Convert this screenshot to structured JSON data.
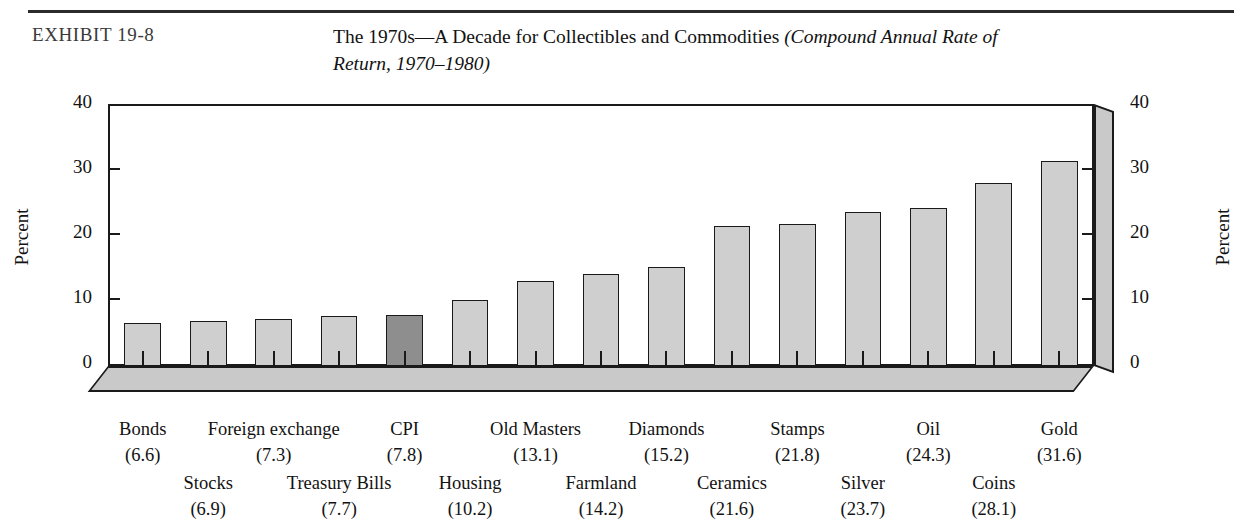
{
  "header": {
    "exhibit_label": "EXHIBIT 19-8",
    "title_line1": "The 1970s—A Decade for Collectibles and Commodities ",
    "title_italic1": "(Compound Annual Rate of",
    "title_italic2": "Return, 1970–1980)"
  },
  "chart_data": {
    "type": "bar",
    "title": "The 1970s—A Decade for Collectibles and Commodities (Compound Annual Rate of Return, 1970–1980)",
    "xlabel": "",
    "ylabel": "Percent",
    "ylabel_right": "Percent",
    "ylim": [
      0,
      40
    ],
    "yticks": [
      0,
      10,
      20,
      30,
      40
    ],
    "ytick_labels": [
      "0",
      "10",
      "20",
      "30",
      "40"
    ],
    "grid": false,
    "legend": "none",
    "highlight_category": "CPI",
    "highlight_color": "#8e8e8e",
    "bar_color": "#cfcfcf",
    "bar_edge_color": "#1a1a1a",
    "categories": [
      "Bonds",
      "Stocks",
      "Foreign exchange",
      "Treasury Bills",
      "CPI",
      "Housing",
      "Old Masters",
      "Farmland",
      "Diamonds",
      "Ceramics",
      "Stamps",
      "Silver",
      "Oil",
      "Coins",
      "Gold"
    ],
    "values": [
      6.6,
      6.9,
      7.3,
      7.7,
      7.8,
      10.2,
      13.1,
      14.2,
      15.2,
      21.6,
      21.8,
      23.7,
      24.3,
      28.1,
      31.6
    ],
    "bars": [
      {
        "name": "Bonds",
        "value": 6.6,
        "label": "(6.6)",
        "row": "top",
        "highlight": false
      },
      {
        "name": "Stocks",
        "value": 6.9,
        "label": "(6.9)",
        "row": "bot",
        "highlight": false
      },
      {
        "name": "Foreign exchange",
        "value": 7.3,
        "label": "(7.3)",
        "row": "top",
        "highlight": false
      },
      {
        "name": "Treasury Bills",
        "value": 7.7,
        "label": "(7.7)",
        "row": "bot",
        "highlight": false
      },
      {
        "name": "CPI",
        "value": 7.8,
        "label": "(7.8)",
        "row": "top",
        "highlight": true
      },
      {
        "name": "Housing",
        "value": 10.2,
        "label": "(10.2)",
        "row": "bot",
        "highlight": false
      },
      {
        "name": "Old Masters",
        "value": 13.1,
        "label": "(13.1)",
        "row": "top",
        "highlight": false
      },
      {
        "name": "Farmland",
        "value": 14.2,
        "label": "(14.2)",
        "row": "bot",
        "highlight": false
      },
      {
        "name": "Diamonds",
        "value": 15.2,
        "label": "(15.2)",
        "row": "top",
        "highlight": false
      },
      {
        "name": "Ceramics",
        "value": 21.6,
        "label": "(21.6)",
        "row": "bot",
        "highlight": false
      },
      {
        "name": "Stamps",
        "value": 21.8,
        "label": "(21.8)",
        "row": "top",
        "highlight": false
      },
      {
        "name": "Silver",
        "value": 23.7,
        "label": "(23.7)",
        "row": "bot",
        "highlight": false
      },
      {
        "name": "Oil",
        "value": 24.3,
        "label": "(24.3)",
        "row": "top",
        "highlight": false
      },
      {
        "name": "Coins",
        "value": 28.1,
        "label": "(28.1)",
        "row": "bot",
        "highlight": false
      },
      {
        "name": "Gold",
        "value": 31.6,
        "label": "(31.6)",
        "row": "top",
        "highlight": false
      }
    ]
  }
}
